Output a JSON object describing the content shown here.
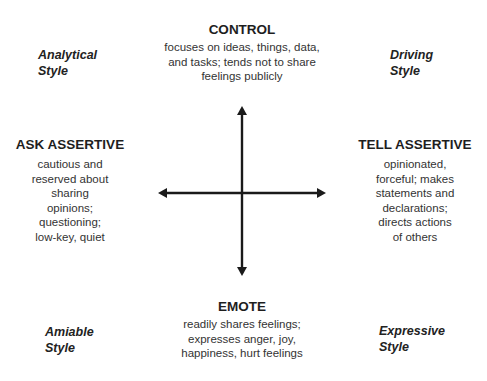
{
  "poles": {
    "top": {
      "heading": "CONTROL",
      "lines": [
        "focuses on ideas, things, data,",
        "and tasks; tends not to share",
        "feelings publicly"
      ]
    },
    "bottom": {
      "heading": "EMOTE",
      "lines": [
        "readily shares feelings;",
        "expresses anger, joy,",
        "happiness, hurt feelings"
      ]
    },
    "left": {
      "heading": "ASK ASSERTIVE",
      "lines": [
        "cautious and",
        "reserved about",
        "sharing",
        "opinions;",
        "questioning;",
        "low-key, quiet"
      ]
    },
    "right": {
      "heading": "TELL ASSERTIVE",
      "lines": [
        "opinionated,",
        "forceful; makes",
        "statements and",
        "declarations;",
        "directs actions",
        "of others"
      ]
    }
  },
  "quadrants": {
    "top_left": [
      "Analytical",
      "Style"
    ],
    "top_right": [
      "Driving",
      "Style"
    ],
    "bottom_left": [
      "Amiable",
      "Style"
    ],
    "bottom_right": [
      "Expressive",
      "Style"
    ]
  },
  "colors": {
    "axis": "#1a1a1a",
    "heading": "#1e1e1e",
    "body_text": "#333333"
  }
}
